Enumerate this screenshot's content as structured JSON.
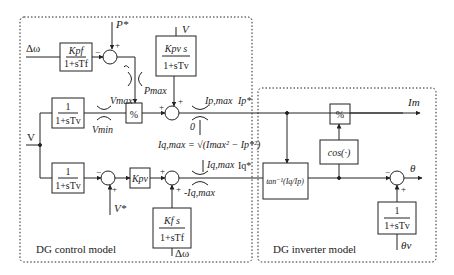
{
  "diagram": {
    "regions": {
      "control": {
        "label": "DG control model"
      },
      "inverter": {
        "label": "DG inverter model"
      }
    },
    "inputs": {
      "delta_omega_top": "Δω",
      "p_ref": "P*",
      "v_top": "V",
      "v_main": "V",
      "v_ref": "V*",
      "delta_omega_bottom": "Δω",
      "theta_v": "θv"
    },
    "blocks": {
      "kpf": {
        "num": "Kpf",
        "den": "1+sTf"
      },
      "kpv_s": {
        "num": "Kpv s",
        "den": "1+sTv"
      },
      "filter_top": {
        "num": "1",
        "den": "1+sTv"
      },
      "divide_top": {
        "label": "%"
      },
      "filter_bottom": {
        "num": "1",
        "den": "1+sTv"
      },
      "kpv": {
        "label": "Kpv"
      },
      "kfs": {
        "num": "Kf s",
        "den": "1+sTf"
      },
      "atan": {
        "label": "tan⁻¹(Iq/Ip)"
      },
      "cos": {
        "label": "cos(·)"
      },
      "divide_inv": {
        "label": "%"
      },
      "filter_theta": {
        "num": "1",
        "den": "1+sTv"
      }
    },
    "limits": {
      "pmax": "Pmax",
      "pmax_low": "0",
      "vmax": "Vmax",
      "vmin": "Vmin",
      "ipmax": "Ip,max",
      "ipmin": "0",
      "iqmax": "Iq,max",
      "iqmin": "-Iq,max"
    },
    "equation": "Iq,max = √(Imax² − Ip*²)",
    "signals": {
      "ip_ref": "Ip*",
      "iq_ref": "Iq*",
      "output_im": "Im",
      "output_theta": "θ"
    },
    "signs": {
      "plus": "+",
      "minus": "−"
    }
  }
}
